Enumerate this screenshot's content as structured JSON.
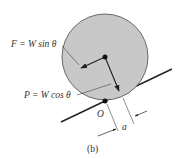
{
  "figure": {
    "caption": "(b)",
    "colors": {
      "disk_fill": "#c8c8c8",
      "disk_stroke": "#5a5a5a",
      "line": "#222222",
      "thin_line": "#444444",
      "text": "#333333"
    },
    "labels": {
      "friction_force": "F = W sin θ",
      "normal_force": "P = W cos θ",
      "contact_point": "O",
      "offset_distance": "a"
    }
  }
}
